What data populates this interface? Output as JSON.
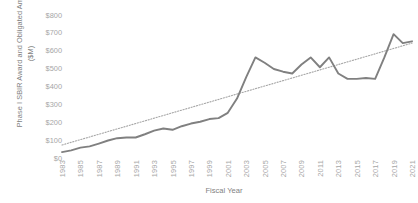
{
  "chart_data": {
    "type": "line",
    "title": "",
    "xlabel": "Fiscal Year",
    "ylabel": "Phase I SBIR Award and Obligated Amounts ($M)",
    "ylim": [
      0,
      800
    ],
    "ytick_labels": [
      "$0",
      "$100",
      "$200",
      "$300",
      "$400",
      "$500",
      "$600",
      "$700",
      "$800"
    ],
    "ytick_values": [
      0,
      100,
      200,
      300,
      400,
      500,
      600,
      700,
      800
    ],
    "xtick_labels": [
      "1983",
      "1985",
      "1987",
      "1989",
      "1991",
      "1993",
      "1995",
      "1997",
      "1999",
      "2001",
      "2003",
      "2005",
      "2007",
      "2009",
      "2011",
      "2013",
      "2015",
      "2017",
      "2019",
      "2021"
    ],
    "grid": false,
    "legend": "none",
    "x": [
      1983,
      1984,
      1985,
      1986,
      1987,
      1988,
      1989,
      1990,
      1991,
      1992,
      1993,
      1994,
      1995,
      1996,
      1997,
      1998,
      1999,
      2000,
      2001,
      2002,
      2003,
      2004,
      2005,
      2006,
      2007,
      2008,
      2009,
      2010,
      2011,
      2012,
      2013,
      2014,
      2015,
      2016,
      2017,
      2018,
      2019,
      2020,
      2021
    ],
    "series": [
      {
        "name": "Phase I SBIR Award and Obligated Amounts",
        "style": "solid",
        "color": "#808080",
        "values": [
          30,
          40,
          55,
          62,
          78,
          95,
          108,
          112,
          112,
          130,
          150,
          162,
          155,
          175,
          190,
          200,
          215,
          220,
          250,
          330,
          450,
          560,
          530,
          495,
          480,
          470,
          520,
          560,
          505,
          560,
          470,
          440,
          440,
          445,
          440,
          560,
          690,
          640,
          650
        ]
      },
      {
        "name": "Linear trendline",
        "style": "dotted",
        "color": "#a6a6a6",
        "values": [
          70,
          85,
          100,
          115,
          130,
          145,
          160,
          175,
          190,
          205,
          220,
          235,
          250,
          265,
          280,
          295,
          310,
          325,
          340,
          355,
          370,
          385,
          400,
          415,
          430,
          445,
          460,
          475,
          490,
          505,
          520,
          535,
          550,
          565,
          580,
          595,
          610,
          625,
          640
        ]
      }
    ]
  }
}
